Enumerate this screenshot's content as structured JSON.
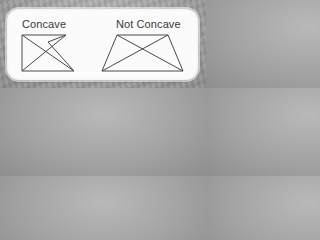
{
  "card": {
    "left_figure": {
      "label": "Concave",
      "shape": "concave-pentagon-with-diagonals"
    },
    "right_figure": {
      "label": "Not Concave",
      "shape": "trapezoid-with-diagonals"
    }
  },
  "colors": {
    "background": "#a3a3a3",
    "card": "#fbfbfb",
    "stroke": "#4a4a4a",
    "text": "#3a3a3a"
  }
}
